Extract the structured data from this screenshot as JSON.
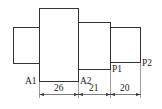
{
  "diagram": {
    "type": "stepped-shaft",
    "line_color": "#333333",
    "segments": [
      {
        "name": "left-stub",
        "x": 13,
        "y": 27,
        "w": 26,
        "h": 36
      },
      {
        "name": "large-section",
        "x": 39,
        "y": 8,
        "w": 39,
        "h": 73
      },
      {
        "name": "middle-section",
        "x": 78,
        "y": 22,
        "w": 32,
        "h": 47
      },
      {
        "name": "right-section",
        "x": 110,
        "y": 27,
        "w": 30,
        "h": 35
      }
    ],
    "points": {
      "a1": "A1",
      "a2": "A2",
      "p1": "P1",
      "p2": "P2"
    },
    "dimensions": {
      "d1": "26",
      "d2": "21",
      "d3": "20"
    }
  }
}
